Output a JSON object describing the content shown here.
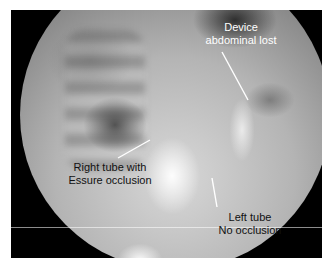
{
  "image": {
    "type": "fluoroscopy radiograph",
    "frame_color": "#000000",
    "background_color": "#ffffff"
  },
  "annotations": [
    {
      "id": "device",
      "lines": [
        "Device",
        "abdominal lost"
      ],
      "text_color": "#ffffff"
    },
    {
      "id": "right-tube",
      "lines": [
        "Right tube with",
        "Essure occlusion"
      ],
      "text_color": "#111111"
    },
    {
      "id": "left-tube",
      "lines": [
        "Left tube",
        "No occlusion"
      ],
      "text_color": "#111111"
    }
  ]
}
